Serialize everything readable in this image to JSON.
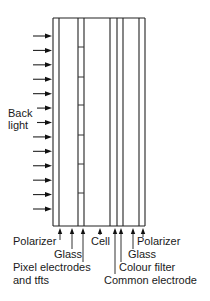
{
  "diagram": {
    "type": "lcd-cross-section",
    "backlight_label": [
      "Back",
      "light"
    ],
    "backlight_arrow_count": 13,
    "frame": {
      "left": 53,
      "right": 145,
      "top": 18,
      "bottom": 226
    },
    "layer_lines_x": [
      53,
      59,
      78,
      84,
      110,
      117,
      123,
      139,
      145
    ],
    "pixel_electrode_ticks_y": [
      47,
      77,
      105,
      135,
      164,
      193
    ],
    "layers": [
      {
        "label": "Polarizer",
        "pointer_x": 60,
        "label_x": 13,
        "label_y": 245,
        "leader_end_y": 240
      },
      {
        "label": "Glass",
        "pointer_x": 72,
        "label_x": 54,
        "label_y": 258,
        "leader_end_y": 249
      },
      {
        "label": "Pixel electrodes",
        "pointer_x": 83,
        "label_x": 13,
        "label_y": 271,
        "leader_end_y": 262
      },
      {
        "label": "and tfts",
        "pointer_x": null,
        "label_x": 13,
        "label_y": 284,
        "leader_end_y": null
      },
      {
        "label": "Cell",
        "pointer_x": 100,
        "label_x": 91,
        "label_y": 245,
        "leader_end_y": 235
      },
      {
        "label": "Common electrode",
        "pointer_x": 115,
        "label_x": 104,
        "label_y": 284,
        "leader_end_y": 274
      },
      {
        "label": "Colour filter",
        "pointer_x": 121,
        "label_x": 119,
        "label_y": 271,
        "leader_end_y": 262
      },
      {
        "label": "Glass",
        "pointer_x": 133,
        "label_x": 128,
        "label_y": 258,
        "leader_end_y": 249
      },
      {
        "label": "Polarizer",
        "pointer_x": 143,
        "label_x": 137,
        "label_y": 245,
        "leader_end_y": 237
      }
    ],
    "colors": {
      "line": "#222222",
      "text": "#1a1a1a",
      "background": "#ffffff"
    }
  }
}
